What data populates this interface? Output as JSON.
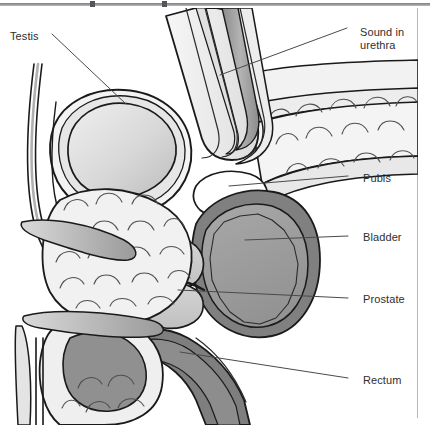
{
  "figure": {
    "title_visible": false,
    "type": "medical-anatomy-illustration",
    "background_color": "#ffffff",
    "outline_color": "#1a1a1a"
  },
  "palette": {
    "outline": "#1a1a1a",
    "paper": "#ffffff",
    "tissue_light": "#f0f0f0",
    "tissue_pale": "#e3e3e3",
    "gray_light": "#cfcfcf",
    "gray_mid": "#9e9e9e",
    "gray_dark": "#808080",
    "gray_darker": "#6e6e6e",
    "label_text": "#2e2e2e",
    "leader_line": "#4a4a4a",
    "rule": "#b5b5ba"
  },
  "labels": [
    {
      "id": "testis",
      "text": "Testis",
      "x": 10,
      "y": 30,
      "align": "left"
    },
    {
      "id": "sound",
      "text": "Sound in",
      "x": 360,
      "y": 26,
      "align": "left"
    },
    {
      "id": "sound2",
      "text": "urethra",
      "x": 360,
      "y": 39,
      "align": "left"
    },
    {
      "id": "pubis",
      "text": "Pubis",
      "x": 363,
      "y": 172,
      "align": "left"
    },
    {
      "id": "bladder",
      "text": "Bladder",
      "x": 363,
      "y": 231,
      "align": "left"
    },
    {
      "id": "prostate",
      "text": "Prostate",
      "x": 363,
      "y": 293,
      "align": "left"
    },
    {
      "id": "rectum",
      "text": "Rectum",
      "x": 363,
      "y": 374,
      "align": "left"
    }
  ],
  "leaders": [
    {
      "id": "testis",
      "points": "52,34 126,104"
    },
    {
      "id": "sound",
      "points": "355,28 228,75"
    },
    {
      "id": "pubis",
      "points": "356,176 237,186"
    },
    {
      "id": "bladder",
      "points": "356,236 253,240"
    },
    {
      "id": "prostate",
      "points": "356,298 186,290"
    },
    {
      "id": "rectum",
      "points": "356,378 188,352"
    }
  ],
  "structures": [
    {
      "id": "testis",
      "name": "Testis",
      "fill": "gray_light"
    },
    {
      "id": "scrotum",
      "name": "Scrotal sac",
      "fill": "tissue_light"
    },
    {
      "id": "penis-shaft",
      "name": "Penis shaft",
      "fill": "tissue_pale"
    },
    {
      "id": "sound",
      "name": "Sound in urethra",
      "fill": "gray_mid"
    },
    {
      "id": "pubis",
      "name": "Pubis",
      "fill": "paper"
    },
    {
      "id": "bladder-wall",
      "name": "Bladder wall",
      "fill": "gray_dark"
    },
    {
      "id": "bladder-lumen",
      "name": "Bladder lumen",
      "fill": "gray_mid"
    },
    {
      "id": "prostate",
      "name": "Prostate",
      "fill": "gray_light"
    },
    {
      "id": "rectum",
      "name": "Rectum",
      "fill": "gray_dark"
    },
    {
      "id": "abdominal-wall",
      "name": "Abdominal wall",
      "fill": "tissue_light"
    },
    {
      "id": "fat-tissue",
      "name": "Subcutaneous fat",
      "fill": "tissue_light"
    },
    {
      "id": "perineum",
      "name": "Perineal tissue",
      "fill": "tissue_light"
    }
  ],
  "topbar": {
    "ticks": [
      90,
      162
    ]
  }
}
